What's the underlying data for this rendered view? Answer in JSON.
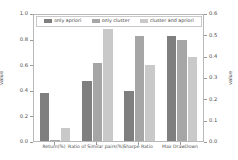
{
  "chart_data": {
    "type": "bar",
    "title": "",
    "xlabel": "",
    "ylabel": "value",
    "ylabel_right": "value",
    "ylim": [
      0.0,
      1.0
    ],
    "ylim_right": [
      0.0,
      0.6
    ],
    "grid": false,
    "legend_position": "upper center",
    "categories": [
      "Return(%)",
      "Ratio of Similar pairs(%)",
      "Sharpe Ratio",
      "Max DrawDown"
    ],
    "yticks_left": [
      "0.0",
      "0.2",
      "0.4",
      "0.6",
      "0.8",
      "1.0"
    ],
    "yticks_left_values": [
      0.0,
      0.2,
      0.4,
      0.6,
      0.8,
      1.0
    ],
    "yticks_right": [
      "0.0",
      "0.1",
      "0.2",
      "0.3",
      "0.4",
      "0.5",
      "0.6"
    ],
    "yticks_right_values": [
      0.0,
      0.1,
      0.2,
      0.3,
      0.4,
      0.5,
      0.6
    ],
    "series": [
      {
        "name": "only apriori",
        "color": "#7f7f7f",
        "values": [
          0.38,
          0.48,
          0.4,
          0.83
        ],
        "values_right_axis": [
          null,
          null,
          null,
          0.5
        ]
      },
      {
        "name": "only cluster",
        "color": "#a6a6a6",
        "values": [
          0.005,
          0.62,
          0.83,
          0.8
        ],
        "values_right_axis": [
          null,
          null,
          null,
          0.48
        ]
      },
      {
        "name": "cluster and apriori",
        "color": "#c9c9c9",
        "values": [
          0.1,
          0.89,
          0.6,
          0.665
        ],
        "values_right_axis": [
          null,
          null,
          null,
          0.4
        ]
      }
    ],
    "note_axis_mapping": "Max DrawDown group is plotted against the right axis (0.0-0.6); the other three groups use the left axis (0.0-1.0)."
  },
  "colors": {
    "series_1": "#7f7f7f",
    "series_2": "#a6a6a6",
    "series_3": "#c9c9c9",
    "axis": "#b8b8b8",
    "text": "#4d4d4d",
    "background": "#ffffff"
  }
}
